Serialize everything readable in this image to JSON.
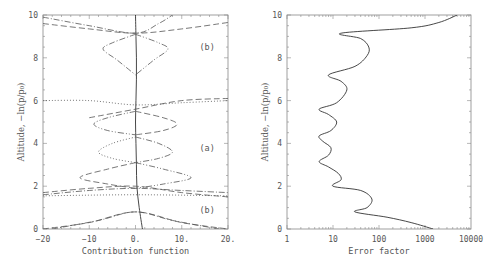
{
  "chart_data": [
    {
      "id": "left",
      "type": "line",
      "title": "",
      "xlabel": "Contribution function",
      "ylabel": "Altitude, −ln(p/p₀)",
      "xlim": [
        -20,
        20
      ],
      "ylim": [
        0,
        10
      ],
      "xticks": [
        -20,
        -10,
        0,
        10,
        20
      ],
      "xtick_labels": [
        "−20",
        "−10",
        "0.",
        "10.",
        "20."
      ],
      "yticks": [
        0,
        2,
        4,
        6,
        8,
        10
      ],
      "ytick_labels": [
        "0",
        "2",
        "4",
        "6",
        "8",
        "10"
      ],
      "grid": false,
      "annotations": [
        {
          "text": "(b)",
          "x": 15.5,
          "y": 8.5
        },
        {
          "text": "(a)",
          "x": 15.5,
          "y": 3.8
        },
        {
          "text": "(b)",
          "x": 15.5,
          "y": 0.9
        }
      ],
      "series": [
        {
          "name": "central-solid",
          "style": "solid",
          "points": [
            [
              1.5,
              0
            ],
            [
              0.8,
              1
            ],
            [
              0.3,
              2
            ],
            [
              0.2,
              3
            ],
            [
              0.1,
              4
            ],
            [
              0,
              5
            ],
            [
              0.1,
              6
            ],
            [
              0.2,
              7
            ],
            [
              0.2,
              8
            ],
            [
              0.1,
              9
            ],
            [
              0,
              10
            ]
          ]
        },
        {
          "name": "top-kernel-1",
          "style": "dashed",
          "points": [
            [
              -20,
              9.6
            ],
            [
              -10,
              9.35
            ],
            [
              0,
              9.15
            ],
            [
              10,
              9.35
            ],
            [
              20,
              9.65
            ]
          ]
        },
        {
          "name": "top-kernel-2",
          "style": "dash-dot",
          "points": [
            [
              -20,
              9.9
            ],
            [
              -10,
              9.5
            ],
            [
              0,
              9.15
            ],
            [
              5,
              9.6
            ],
            [
              8,
              10
            ]
          ]
        },
        {
          "name": "upper-loop-1",
          "style": "dash-dot",
          "points": [
            [
              0,
              9.1
            ],
            [
              -5,
              8.7
            ],
            [
              -7,
              8.4
            ],
            [
              -4,
              7.9
            ],
            [
              0,
              7.2
            ]
          ]
        },
        {
          "name": "upper-loop-2",
          "style": "dash-dot-dot",
          "points": [
            [
              0,
              9.1
            ],
            [
              5,
              8.7
            ],
            [
              7,
              8.4
            ],
            [
              4,
              7.9
            ],
            [
              0,
              7.2
            ]
          ]
        },
        {
          "name": "mid-kernel-1",
          "style": "dotted",
          "points": [
            [
              -20,
              6.0
            ],
            [
              -10,
              6.0
            ],
            [
              0,
              5.8
            ],
            [
              10,
              5.9
            ],
            [
              20,
              6.0
            ]
          ]
        },
        {
          "name": "mid-kernel-2",
          "style": "dashed",
          "points": [
            [
              -10,
              5.2
            ],
            [
              0,
              5.6
            ],
            [
              10,
              6.0
            ],
            [
              20,
              6.1
            ]
          ]
        },
        {
          "name": "mid-loop-1",
          "style": "dash-dot-dot",
          "points": [
            [
              0,
              5.5
            ],
            [
              -6,
              5.2
            ],
            [
              -9,
              4.9
            ],
            [
              -6,
              4.6
            ],
            [
              0,
              4.4
            ]
          ]
        },
        {
          "name": "mid-loop-2",
          "style": "dashed",
          "points": [
            [
              0,
              5.5
            ],
            [
              6,
              5.2
            ],
            [
              9,
              4.9
            ],
            [
              6,
              4.6
            ],
            [
              0,
              4.4
            ]
          ]
        },
        {
          "name": "lower-loop-1",
          "style": "dotted",
          "points": [
            [
              0,
              4.3
            ],
            [
              -5,
              4.0
            ],
            [
              -8,
              3.6
            ],
            [
              -5,
              3.3
            ],
            [
              0,
              3.1
            ]
          ]
        },
        {
          "name": "lower-loop-2",
          "style": "dash-dot",
          "points": [
            [
              0,
              4.3
            ],
            [
              5,
              4.0
            ],
            [
              8,
              3.6
            ],
            [
              5,
              3.3
            ],
            [
              0,
              3.1
            ]
          ]
        },
        {
          "name": "bottom-loop-1",
          "style": "dashed",
          "points": [
            [
              0,
              3.1
            ],
            [
              -6,
              2.8
            ],
            [
              -12,
              2.4
            ],
            [
              -6,
              2.1
            ],
            [
              0,
              1.9
            ]
          ]
        },
        {
          "name": "bottom-loop-2",
          "style": "dash-dot-dot",
          "points": [
            [
              0,
              3.1
            ],
            [
              6,
              2.8
            ],
            [
              12,
              2.4
            ],
            [
              6,
              2.1
            ],
            [
              0,
              1.9
            ]
          ]
        },
        {
          "name": "low-kernel-1",
          "style": "dashed",
          "points": [
            [
              -20,
              1.7
            ],
            [
              -10,
              1.9
            ],
            [
              0,
              2.0
            ],
            [
              10,
              1.7
            ],
            [
              20,
              1.5
            ]
          ]
        },
        {
          "name": "low-kernel-2",
          "style": "dash-dot",
          "points": [
            [
              -20,
              1.6
            ],
            [
              -10,
              1.8
            ],
            [
              0,
              1.9
            ],
            [
              10,
              1.8
            ],
            [
              20,
              1.7
            ]
          ]
        },
        {
          "name": "low-kernel-3",
          "style": "dotted",
          "points": [
            [
              -20,
              1.55
            ],
            [
              0,
              1.6
            ],
            [
              20,
              1.55
            ]
          ]
        },
        {
          "name": "surface-kernel-1",
          "style": "dashed",
          "points": [
            [
              -20,
              0
            ],
            [
              -10,
              0.3
            ],
            [
              0,
              0.8
            ],
            [
              10,
              0.3
            ],
            [
              20,
              0
            ]
          ]
        },
        {
          "name": "surface-kernel-2",
          "style": "dash-dot",
          "points": [
            [
              -18,
              0
            ],
            [
              -8,
              0.4
            ],
            [
              0,
              0.8
            ],
            [
              8,
              0.4
            ],
            [
              18,
              0
            ]
          ]
        }
      ]
    },
    {
      "id": "right",
      "type": "line",
      "title": "",
      "xlabel": "Error factor",
      "ylabel": "Altitude, −ln(p/p₀)",
      "xscale": "log",
      "xlim": [
        1,
        10000
      ],
      "ylim": [
        0,
        10
      ],
      "xticks": [
        1,
        10,
        100,
        1000,
        10000
      ],
      "xtick_labels": [
        "1",
        "10",
        "100",
        "1000",
        "10000"
      ],
      "yticks": [
        0,
        2,
        4,
        6,
        8,
        10
      ],
      "ytick_labels": [
        "0",
        "2",
        "4",
        "6",
        "8",
        "10"
      ],
      "grid": false,
      "series": [
        {
          "name": "error-factor",
          "style": "solid",
          "points": [
            [
              1500,
              0
            ],
            [
              500,
              0.3
            ],
            [
              150,
              0.55
            ],
            [
              30,
              0.8
            ],
            [
              55,
              1.0
            ],
            [
              70,
              1.4
            ],
            [
              40,
              1.8
            ],
            [
              10,
              2.0
            ],
            [
              15,
              2.3
            ],
            [
              13,
              2.6
            ],
            [
              8,
              2.9
            ],
            [
              5,
              3.15
            ],
            [
              8,
              3.45
            ],
            [
              9,
              3.8
            ],
            [
              6,
              4.1
            ],
            [
              5,
              4.35
            ],
            [
              9,
              4.6
            ],
            [
              12,
              5.0
            ],
            [
              8,
              5.35
            ],
            [
              5,
              5.6
            ],
            [
              12,
              5.9
            ],
            [
              20,
              6.5
            ],
            [
              15,
              6.9
            ],
            [
              8,
              7.2
            ],
            [
              30,
              7.6
            ],
            [
              55,
              8.1
            ],
            [
              60,
              8.5
            ],
            [
              40,
              8.9
            ],
            [
              15,
              9.15
            ],
            [
              500,
              9.4
            ],
            [
              2000,
              9.65
            ],
            [
              5000,
              10
            ]
          ]
        }
      ]
    }
  ]
}
